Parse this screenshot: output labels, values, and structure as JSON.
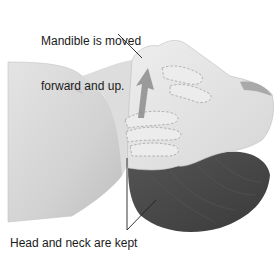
{
  "figure": {
    "colors": {
      "background": "#ffffff",
      "skin_light": "#e6e6e6",
      "skin_mid": "#cfcfcf",
      "skin_shadow": "#b5b5b5",
      "hair": "#4a4a4a",
      "hair_dark": "#333333",
      "arrow": "#8c8c8c",
      "leader_line": "#222222",
      "text": "#1a1a1a"
    }
  },
  "annotations": {
    "top_line1": "Mandible is moved",
    "top_line2": "forward and up.",
    "bottom": "Head and neck are kept"
  }
}
